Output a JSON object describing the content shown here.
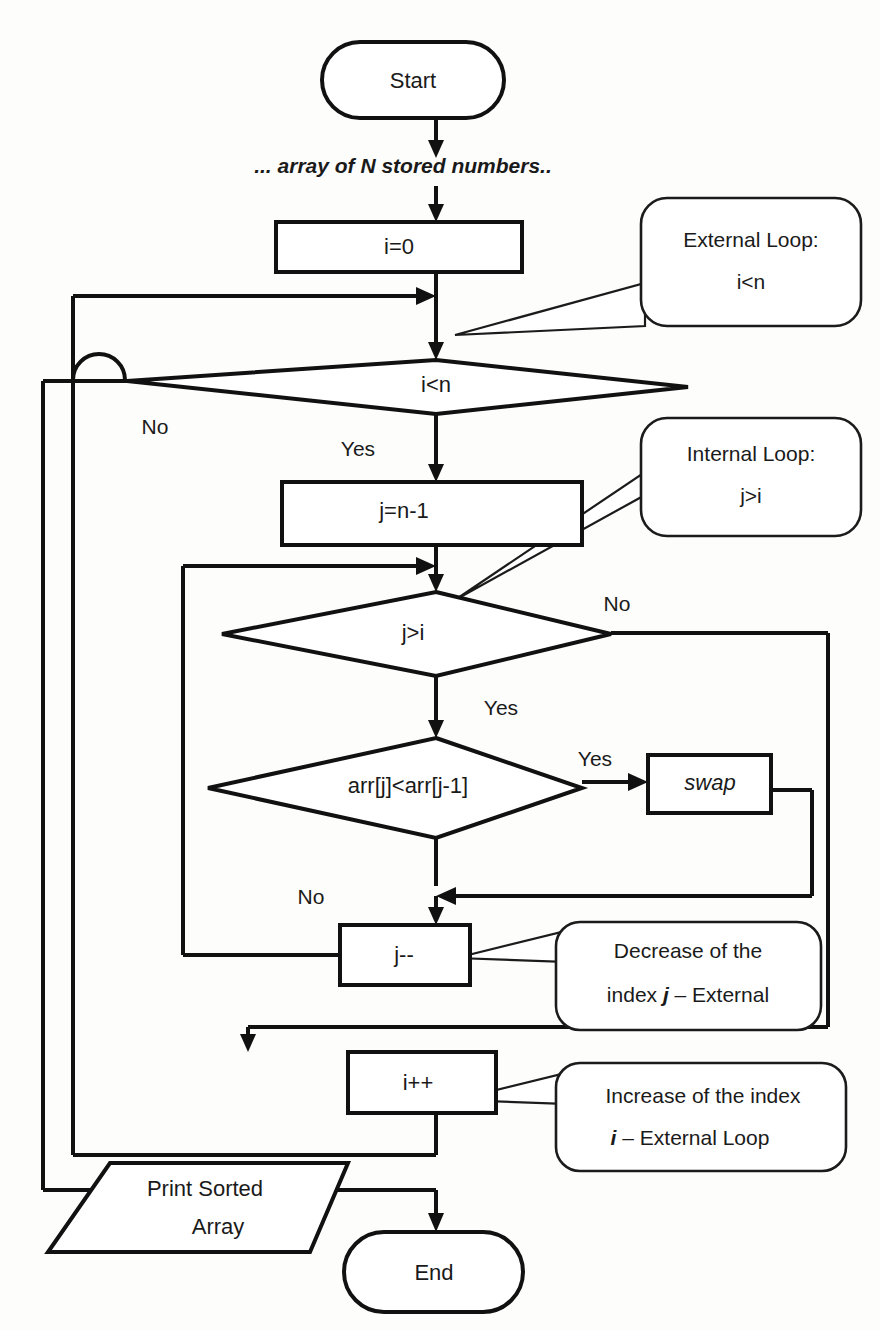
{
  "diagram": {
    "type": "flowchart",
    "nodes": {
      "start": {
        "label": "Start",
        "shape": "terminator"
      },
      "input_note": {
        "label": "... array of N stored numbers..",
        "shape": "annotation-italic"
      },
      "init_i": {
        "label": "i=0",
        "shape": "process"
      },
      "cond_outer": {
        "label": "i<n",
        "shape": "decision"
      },
      "init_j": {
        "label": "j=n-1",
        "shape": "process"
      },
      "cond_inner": {
        "label": "j>i",
        "shape": "decision"
      },
      "cond_compare": {
        "label": "arr[j]<arr[j-1]",
        "shape": "decision"
      },
      "swap": {
        "label": "swap",
        "shape": "process-italic"
      },
      "dec_j": {
        "label": "j--",
        "shape": "process"
      },
      "inc_i": {
        "label": "i++",
        "shape": "process"
      },
      "print": {
        "label_line1": "Print Sorted",
        "label_line2": "Array",
        "shape": "parallelogram"
      },
      "end": {
        "label": "End",
        "shape": "terminator"
      }
    },
    "branch_labels": {
      "outer_no": "No",
      "outer_yes": "Yes",
      "inner_no": "No",
      "inner_yes": "Yes",
      "compare_yes": "Yes",
      "compare_no": "No"
    },
    "callouts": {
      "external_loop": {
        "line1": "External Loop:",
        "line2": "i<n"
      },
      "internal_loop": {
        "line1": "Internal Loop:",
        "line2": "j>i"
      },
      "decrease_j": {
        "line1": "Decrease of the",
        "line2_pre": "index ",
        "line2_idx": "j",
        "line2_post": " – External"
      },
      "increase_i": {
        "line1": "Increase of the index",
        "line2_idx": "i",
        "line2_post": " – External Loop"
      }
    },
    "colors": {
      "stroke": "#111111",
      "fill": "#ffffff",
      "background": "#fdfdfc",
      "text": "#1a1a1a"
    }
  }
}
